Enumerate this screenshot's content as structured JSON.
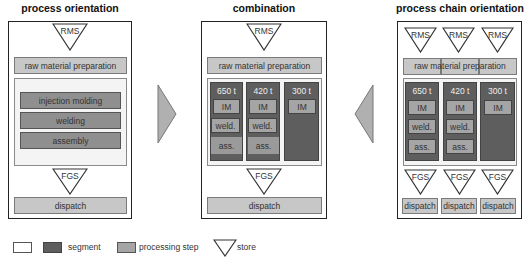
{
  "panels": {
    "process_orientation": {
      "title": "process orientation",
      "store_top": "RMS",
      "raw_material": "raw material preparation",
      "steps": [
        "injection molding",
        "welding",
        "assembly"
      ],
      "store_bottom": "FGS",
      "dispatch": "dispatch"
    },
    "combination": {
      "title": "combination",
      "store_top": "RMS",
      "raw_material": "raw material preparation",
      "segments": [
        {
          "label": "650 t",
          "steps": [
            "IM",
            "weld.",
            "ass."
          ]
        },
        {
          "label": "420 t",
          "steps": [
            "IM",
            "weld.",
            "ass."
          ]
        },
        {
          "label": "300 t",
          "steps": [
            "IM"
          ]
        }
      ],
      "store_bottom": "FGS",
      "dispatch": "dispatch"
    },
    "process_chain_orientation": {
      "title": "process chain orientation",
      "stores_top": [
        "RMS",
        "RMS",
        "RMS"
      ],
      "raw_material": "raw material preparation",
      "segments": [
        {
          "label": "650 t",
          "steps": [
            "IM",
            "weld.",
            "ass."
          ]
        },
        {
          "label": "420 t",
          "steps": [
            "IM",
            "weld.",
            "ass."
          ]
        },
        {
          "label": "300 t",
          "steps": [
            "IM"
          ]
        }
      ],
      "stores_bottom": [
        "FGS",
        "FGS",
        "FGS"
      ],
      "dispatches": [
        "dispatch",
        "dispatch",
        "dispatch"
      ]
    }
  },
  "arrows": {
    "left": "arrow-right",
    "right": "arrow-left"
  },
  "legend": {
    "empty_box": "",
    "segment": "segment",
    "processing_step": "processing step",
    "store": "store"
  },
  "colors": {
    "segment": "#5e5e5e",
    "processing_step": "#c7c7c7",
    "area": "#f4f4f4",
    "arrow": "#b0b0b0"
  }
}
